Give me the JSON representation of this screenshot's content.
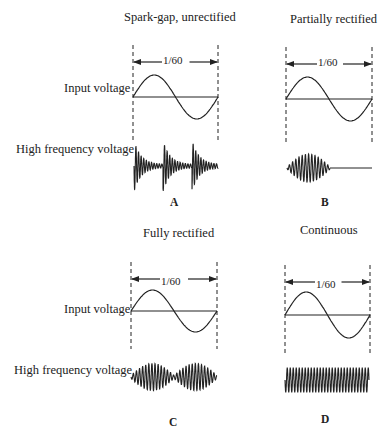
{
  "figure": {
    "top_cutoff_text": "~~~~~",
    "row_labels": {
      "input_voltage": "Input voltage",
      "high_frequency_voltage": "High frequency voltage"
    },
    "panels": [
      {
        "id": "A",
        "letter": "A",
        "title": "Spark-gap, unrectified",
        "period_label": "1/60",
        "hf_type": "spark-gap: three damped bursts per cycle"
      },
      {
        "id": "B",
        "letter": "B",
        "title": "Partially rectified",
        "period_label": "1/60",
        "hf_type": "single burst during positive half-cycle, flat during negative"
      },
      {
        "id": "C",
        "letter": "C",
        "title": "Fully rectified",
        "period_label": "1/60",
        "hf_type": "two envelopes, one per half-cycle"
      },
      {
        "id": "D",
        "letter": "D",
        "title": "Continuous",
        "period_label": "1/60",
        "hf_type": "constant amplitude continuous wave"
      }
    ],
    "colors": {
      "ink": "#222222",
      "background": "#ffffff"
    }
  }
}
